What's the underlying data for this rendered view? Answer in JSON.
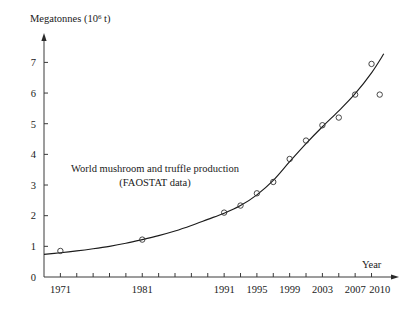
{
  "chart_data": {
    "type": "scatter",
    "title": "",
    "annotation_lines": [
      "World mushroom and truffle production",
      "(FAOSTAT data)"
    ],
    "ylabel": "Megatonnes (10",
    "ylabel_sup": "6",
    "ylabel_tail": " t)",
    "xlabel": "Year",
    "ylim": [
      0,
      7.6
    ],
    "xlim": [
      1969,
      2011.5
    ],
    "grid": false,
    "legend": "none",
    "yticks": [
      0,
      1,
      2,
      3,
      4,
      5,
      6,
      7
    ],
    "ytick_labels": [
      "0",
      "1",
      "2",
      "3",
      "4",
      "5",
      "6",
      "7"
    ],
    "xticks": [
      1971,
      1973,
      1975,
      1977,
      1979,
      1981,
      1983,
      1985,
      1987,
      1989,
      1991,
      1993,
      1995,
      1997,
      1999,
      2001,
      2003,
      2005,
      2007,
      2009
    ],
    "xtick_labels": [
      {
        "x": 1971,
        "label": "1971"
      },
      {
        "x": 1981,
        "label": "1981"
      },
      {
        "x": 1991,
        "label": "1991"
      },
      {
        "x": 1995,
        "label": "1995"
      },
      {
        "x": 1999,
        "label": "1999"
      },
      {
        "x": 2003,
        "label": "2003"
      },
      {
        "x": 2007,
        "label": "2007"
      },
      {
        "x": 2010,
        "label": "2010"
      }
    ],
    "x": [
      1971,
      1981,
      1991,
      1993,
      1995,
      1997,
      1999,
      2001,
      2003,
      2005,
      2007,
      2009,
      2010
    ],
    "y": [
      0.85,
      1.22,
      2.1,
      2.33,
      2.73,
      3.1,
      3.85,
      4.45,
      4.95,
      5.2,
      5.95,
      6.95,
      5.95
    ],
    "series": [
      {
        "name": "World mushroom and truffle production",
        "marker": "open-circle",
        "points": [
          {
            "x": 1971,
            "y": 0.85
          },
          {
            "x": 1981,
            "y": 1.22
          },
          {
            "x": 1991,
            "y": 2.1
          },
          {
            "x": 1993,
            "y": 2.33
          },
          {
            "x": 1995,
            "y": 2.73
          },
          {
            "x": 1997,
            "y": 3.1
          },
          {
            "x": 1999,
            "y": 3.85
          },
          {
            "x": 2001,
            "y": 4.45
          },
          {
            "x": 2003,
            "y": 4.95
          },
          {
            "x": 2005,
            "y": 5.2
          },
          {
            "x": 2007,
            "y": 5.95
          },
          {
            "x": 2009,
            "y": 6.95
          },
          {
            "x": 2010,
            "y": 5.95
          }
        ]
      },
      {
        "name": "fitted exponential trend curve",
        "marker": "none",
        "curve_points": [
          {
            "x": 1969.0,
            "y": 0.74
          },
          {
            "x": 1971.0,
            "y": 0.79
          },
          {
            "x": 1973.0,
            "y": 0.85
          },
          {
            "x": 1975.0,
            "y": 0.92
          },
          {
            "x": 1977.0,
            "y": 1.0
          },
          {
            "x": 1979.0,
            "y": 1.1
          },
          {
            "x": 1981.0,
            "y": 1.22
          },
          {
            "x": 1983.0,
            "y": 1.35
          },
          {
            "x": 1985.0,
            "y": 1.5
          },
          {
            "x": 1987.0,
            "y": 1.68
          },
          {
            "x": 1989.0,
            "y": 1.88
          },
          {
            "x": 1991.0,
            "y": 2.08
          },
          {
            "x": 1993.0,
            "y": 2.33
          },
          {
            "x": 1995.0,
            "y": 2.68
          },
          {
            "x": 1997.0,
            "y": 3.15
          },
          {
            "x": 1999.0,
            "y": 3.76
          },
          {
            "x": 2001.0,
            "y": 4.35
          },
          {
            "x": 2003.0,
            "y": 4.9
          },
          {
            "x": 2005.0,
            "y": 5.42
          },
          {
            "x": 2007.0,
            "y": 5.98
          },
          {
            "x": 2009.0,
            "y": 6.66
          },
          {
            "x": 2010.5,
            "y": 7.28
          }
        ]
      }
    ]
  },
  "axes": {
    "y_axis_name": "y-axis",
    "x_axis_name": "x-axis"
  }
}
